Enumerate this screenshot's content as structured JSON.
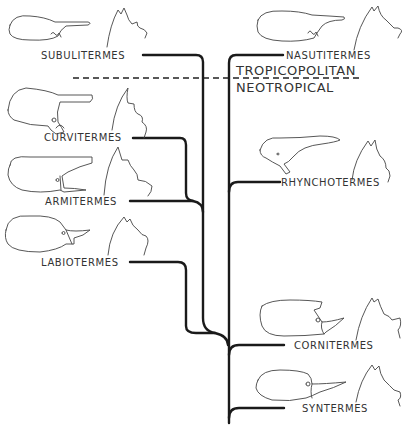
{
  "figure": {
    "regions": {
      "upper": "TROPICOPOLITAN",
      "lower": "NEOTROPICAL"
    },
    "taxa": [
      {
        "id": "subulitermes",
        "label": "SUBULITERMES",
        "side": "left"
      },
      {
        "id": "curvitermes",
        "label": "CURVITERMES",
        "side": "left"
      },
      {
        "id": "armitermes",
        "label": "ARMITERMES",
        "side": "left"
      },
      {
        "id": "labiotermes",
        "label": "LABIOTERMES",
        "side": "left"
      },
      {
        "id": "nasutitermes",
        "label": "NASUTITERMES",
        "side": "right"
      },
      {
        "id": "rhynchotermes",
        "label": "RHYNCHOTERMES",
        "side": "right"
      },
      {
        "id": "cornitermes",
        "label": "CORNITERMES",
        "side": "right"
      },
      {
        "id": "syntermes",
        "label": "SYNTERMES",
        "side": "right"
      }
    ]
  }
}
